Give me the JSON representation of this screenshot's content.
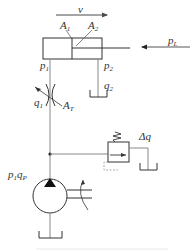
{
  "diagram": {
    "type": "hydraulic-circuit",
    "colors": {
      "line": "#4a4a4a",
      "thin_line": "#8a8a8a",
      "background": "#ffffff"
    },
    "labels": {
      "velocity": "v",
      "area1_main": "A",
      "area1_sub": "1",
      "area2_main": "A",
      "area2_sub": "2",
      "load_pressure_main": "p",
      "load_pressure_sub": "L",
      "p1_main": "p",
      "p1_sub": "1",
      "p2_main": "p",
      "p2_sub": "2",
      "q2_main": "q",
      "q2_sub": "2",
      "q1_main": "q",
      "q1_sub": "1",
      "throttle_area_main": "A",
      "throttle_area_sub": "T",
      "relief_flow": "Δq",
      "pump_main_p": "p",
      "pump_sub_1": "1",
      "pump_main_q": "q",
      "pump_sub_p": "P"
    },
    "components": [
      {
        "id": "hydraulic-cylinder",
        "label": "double-acting cylinder with rod"
      },
      {
        "id": "throttle-valve",
        "label": "variable throttle"
      },
      {
        "id": "relief-valve",
        "label": "relief valve"
      },
      {
        "id": "pump",
        "label": "hydraulic pump"
      },
      {
        "id": "tank-return-cylinder",
        "label": "tank"
      },
      {
        "id": "tank-relief",
        "label": "tank"
      },
      {
        "id": "tank-pump",
        "label": "tank"
      }
    ]
  }
}
